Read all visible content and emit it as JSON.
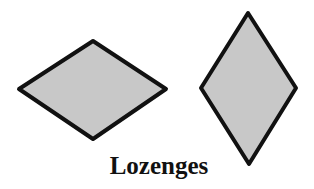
{
  "caption": "Lozenges",
  "style": {
    "fill": "#c8c8c8",
    "stroke": "#111111",
    "stroke_width": 4
  },
  "shapes": [
    {
      "name": "horizontal-lozenge",
      "points": "19,89 93,41 166,89 93,139"
    },
    {
      "name": "vertical-lozenge",
      "points": "248,13 296,88 249,164 201,88"
    }
  ]
}
